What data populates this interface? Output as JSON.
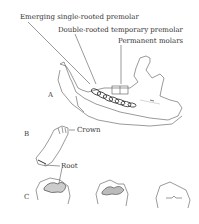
{
  "figure": {
    "labels": {
      "emerging_premolar": "Emerging single-rooted premolar",
      "double_rooted_premolar": "Double-rooted temporary premolar",
      "permanent_molars": "Permanent molars",
      "crown": "Crown",
      "root": "Root"
    },
    "panels": {
      "a": "A",
      "b": "B",
      "c": "C"
    }
  }
}
